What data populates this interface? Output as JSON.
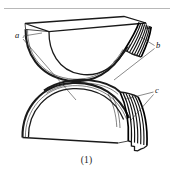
{
  "figure": {
    "caption": "(1)",
    "labels": [
      {
        "id": "a",
        "text": "a",
        "x": 18,
        "y": 37,
        "target": "upper-bowl-inner-face"
      },
      {
        "id": "b",
        "text": "b",
        "x": 158,
        "y": 47,
        "target": "upper-lamination-edge"
      },
      {
        "id": "c",
        "text": "c",
        "x": 157,
        "y": 93,
        "target": "lower-lamination-edge"
      }
    ],
    "colors": {
      "background": "#ffffff",
      "ink": "#1a1a1a",
      "leader": "#3a3a3a",
      "rule": "#9a9a9a",
      "lamination": "#000000"
    },
    "parts": {
      "upper": "bowl",
      "lower": "arch",
      "top_rule": "page-separator-line"
    }
  }
}
